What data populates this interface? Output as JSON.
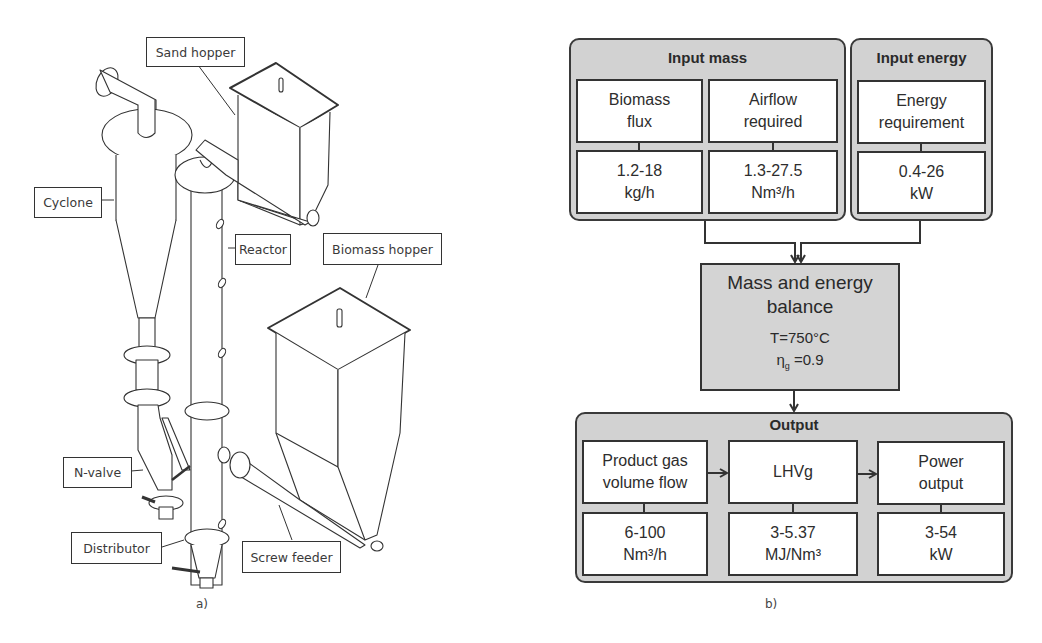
{
  "panel_a": {
    "caption": "a)",
    "callouts": {
      "sand_hopper": "Sand hopper",
      "cyclone": "Cyclone",
      "reactor": "Reactor",
      "biomass_hopper": "Biomass hopper",
      "n_valve": "N-valve",
      "distributor": "Distributor",
      "screw_feeder": "Screw feeder"
    }
  },
  "panel_b": {
    "caption": "b)",
    "input_mass": {
      "title": "Input mass",
      "items": [
        {
          "label_line1": "Biomass",
          "label_line2": "flux",
          "value": "1.2-18",
          "unit": "kg/h"
        },
        {
          "label_line1": "Airflow",
          "label_line2": "required",
          "value": "1.3-27.5",
          "unit": "Nm³/h"
        }
      ]
    },
    "input_energy": {
      "title": "Input energy",
      "items": [
        {
          "label_line1": "Energy",
          "label_line2": "requirement",
          "value": "0.4-26",
          "unit": "kW"
        }
      ]
    },
    "balance": {
      "title_line1": "Mass and energy",
      "title_line2": "balance",
      "temperature": "T=750°C",
      "efficiency_symbol": "η",
      "efficiency_subscript": "g",
      "efficiency_value": " =0.9"
    },
    "output": {
      "title": "Output",
      "items": [
        {
          "label_line1": "Product gas",
          "label_line2": "volume flow",
          "value": "6-100",
          "unit": "Nm³/h"
        },
        {
          "label_line1": "LHVg",
          "label_line2": "",
          "value": "3-5.37",
          "unit": "MJ/Nm³"
        },
        {
          "label_line1": "Power",
          "label_line2": "output",
          "value": "3-54",
          "unit": "kW"
        }
      ]
    }
  },
  "colors": {
    "group_fill": "#d2d2d2",
    "cell_fill": "#ffffff",
    "stroke": "#333333"
  }
}
